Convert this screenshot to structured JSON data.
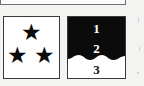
{
  "page": {
    "kind": "scanned-document-fragment",
    "background_color": "#f3f3f1",
    "width": 144,
    "height": 86
  },
  "top_box": {
    "name": "cropped-box-above",
    "border_color": "#6f6f6f",
    "fill_color": "#fbfbfa",
    "note": "only bottom edge visible"
  },
  "stars_box": {
    "label": "three-star symbol",
    "fill_color": "#ffffff",
    "border_color": "#3a3a3a",
    "star_color": "#0b0b0b",
    "star_count": 3,
    "stars": [
      {
        "name": "star-top",
        "glyph": "★"
      },
      {
        "name": "star-left",
        "glyph": "★"
      },
      {
        "name": "star-right",
        "glyph": "★"
      }
    ]
  },
  "layers_box": {
    "label": "layered fill symbol",
    "border_color": "#3a3a3a",
    "upper_fill_color": "#0b0b0b",
    "lower_fill_color": "#ffffff",
    "divider_style": "wavy",
    "labels": [
      {
        "name": "layer-label-1",
        "text": "1",
        "color": "#ffffff"
      },
      {
        "name": "layer-label-2",
        "text": "2",
        "color": "#ffffff"
      },
      {
        "name": "layer-label-3",
        "text": "3",
        "color": "#111111"
      }
    ]
  }
}
